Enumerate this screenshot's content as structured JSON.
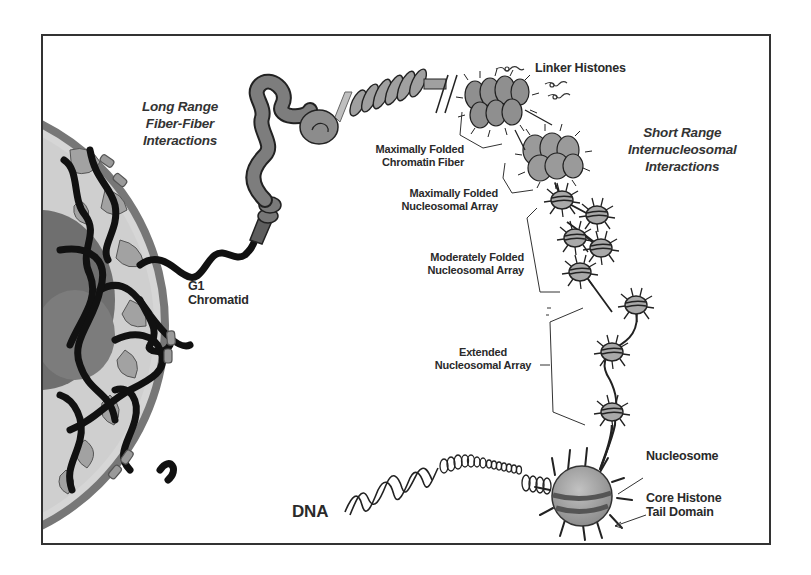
{
  "diagram": {
    "type": "chromatin-hierarchy-illustration",
    "labels": {
      "long_range": [
        "Long Range",
        "Fiber-Fiber",
        "Interactions"
      ],
      "short_range": [
        "Short Range",
        "Internucleosomal",
        "Interactions"
      ],
      "linker_histones": "Linker Histones",
      "max_folded_fiber": [
        "Maximally Folded",
        "Chromatin Fiber"
      ],
      "max_folded_array": [
        "Maximally Folded",
        "Nucleosomal Array"
      ],
      "mod_folded_array": [
        "Moderately Folded",
        "Nucleosomal Array"
      ],
      "extended_array": [
        "Extended",
        "Nucleosomal Array"
      ],
      "g1_chromatid": [
        "G1",
        "Chromatid"
      ],
      "nucleosome": "Nucleosome",
      "core_histone": [
        "Core Histone",
        "Tail Domain"
      ],
      "dna": "DNA"
    },
    "colors": {
      "frame": "#333333",
      "fiber_dark": "#7a7a7a",
      "fiber_light": "#a8a8a8",
      "nucleosome_fill": "#a9a9a9",
      "chromatin_black": "#111111",
      "nucleus_bg": "#c8c8c8",
      "nucleolus": "#6f6f6f",
      "text": "#2a2a2a"
    }
  }
}
